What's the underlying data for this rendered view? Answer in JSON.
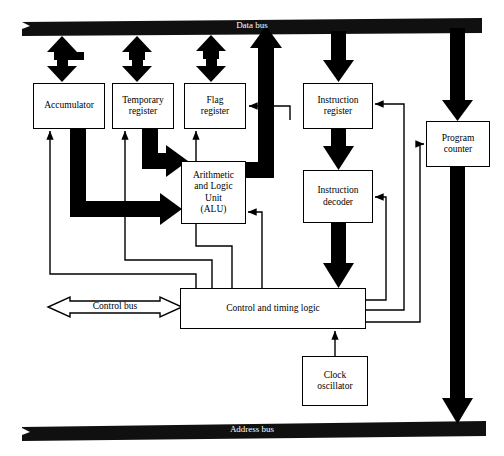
{
  "diagram": {
    "colors": {
      "line": "#000000",
      "fill": "#ffffff",
      "bus": "#111111",
      "bus_text": "#ffffff"
    },
    "buses": [
      {
        "id": "data-bus",
        "label": "Data bus",
        "orientation": "horizontal",
        "y": 24,
        "style": "solid-black-bar"
      },
      {
        "id": "address-bus",
        "label": "Address bus",
        "orientation": "horizontal",
        "y": 428,
        "style": "solid-black-bar"
      },
      {
        "id": "control-bus",
        "label": "Control bus",
        "orientation": "horizontal",
        "y": 307,
        "style": "hollow-double-arrow"
      }
    ],
    "blocks": [
      {
        "id": "accumulator",
        "label": "Accumulator",
        "x": 33,
        "y": 83,
        "w": 72,
        "h": 46
      },
      {
        "id": "temporary-register",
        "label": "Temporary\nregister",
        "x": 112,
        "y": 83,
        "w": 62,
        "h": 46
      },
      {
        "id": "flag-register",
        "label": "Flag\nregister",
        "x": 184,
        "y": 83,
        "w": 62,
        "h": 46
      },
      {
        "id": "alu",
        "label": "Arithmetic\nand Logic\nUnit\n(ALU)",
        "x": 181,
        "y": 161,
        "w": 65,
        "h": 63
      },
      {
        "id": "instruction-register",
        "label": "Instruction\nregister",
        "x": 303,
        "y": 83,
        "w": 70,
        "h": 46
      },
      {
        "id": "instruction-decoder",
        "label": "Instruction\ndecoder",
        "x": 303,
        "y": 170,
        "w": 70,
        "h": 53
      },
      {
        "id": "program-counter",
        "label": "Program\ncounter",
        "x": 426,
        "y": 121,
        "w": 64,
        "h": 46
      },
      {
        "id": "control-timing-logic",
        "label": "Control and timing logic",
        "x": 180,
        "y": 288,
        "w": 186,
        "h": 41
      },
      {
        "id": "clock-oscillator",
        "label": "Clock\noscillator",
        "x": 302,
        "y": 356,
        "w": 66,
        "h": 50
      }
    ],
    "connections": [
      {
        "id": "data-bus-to-accumulator",
        "from": "data-bus",
        "to": "accumulator",
        "kind": "thick-double-arrow"
      },
      {
        "id": "data-bus-to-temporary-register",
        "from": "data-bus",
        "to": "temporary-register",
        "kind": "thick-double-arrow"
      },
      {
        "id": "data-bus-to-flag-register",
        "from": "data-bus",
        "to": "flag-register",
        "kind": "thick-double-arrow"
      },
      {
        "id": "alu-to-data-bus",
        "from": "alu",
        "to": "data-bus",
        "kind": "thick-arrow-up"
      },
      {
        "id": "data-bus-to-instruction-register",
        "from": "data-bus",
        "to": "instruction-register",
        "kind": "thick-arrow-down"
      },
      {
        "id": "data-bus-to-program-counter",
        "from": "data-bus",
        "to": "program-counter",
        "kind": "thick-arrow-down"
      },
      {
        "id": "accumulator-to-alu",
        "from": "accumulator",
        "to": "alu",
        "kind": "thick-arrow-right"
      },
      {
        "id": "temporary-register-to-alu",
        "from": "temporary-register",
        "to": "alu",
        "kind": "thick-arrow-right"
      },
      {
        "id": "instruction-register-to-decoder",
        "from": "instruction-register",
        "to": "instruction-decoder",
        "kind": "thick-arrow-down"
      },
      {
        "id": "instruction-decoder-to-control",
        "from": "instruction-decoder",
        "to": "control-timing-logic",
        "kind": "thick-arrow-down"
      },
      {
        "id": "program-counter-to-address-bus",
        "from": "program-counter",
        "to": "address-bus",
        "kind": "thick-arrow-down"
      },
      {
        "id": "clock-oscillator-to-control",
        "from": "clock-oscillator",
        "to": "control-timing-logic",
        "kind": "thin-arrow-up"
      },
      {
        "id": "control-to-accumulator",
        "from": "control-timing-logic",
        "to": "accumulator",
        "kind": "thin-arrow"
      },
      {
        "id": "control-to-temporary-register",
        "from": "control-timing-logic",
        "to": "temporary-register",
        "kind": "thin-arrow"
      },
      {
        "id": "control-to-flag-register",
        "from": "control-timing-logic",
        "to": "flag-register",
        "kind": "thin-arrow"
      },
      {
        "id": "control-to-alu",
        "from": "control-timing-logic",
        "to": "alu",
        "kind": "thin-arrow"
      },
      {
        "id": "control-to-instruction-register",
        "from": "control-timing-logic",
        "to": "instruction-register",
        "kind": "thin-arrow"
      },
      {
        "id": "control-to-instruction-decoder",
        "from": "control-timing-logic",
        "to": "instruction-decoder",
        "kind": "thin-arrow"
      },
      {
        "id": "control-to-program-counter",
        "from": "control-timing-logic",
        "to": "program-counter",
        "kind": "thin-arrow"
      }
    ]
  }
}
